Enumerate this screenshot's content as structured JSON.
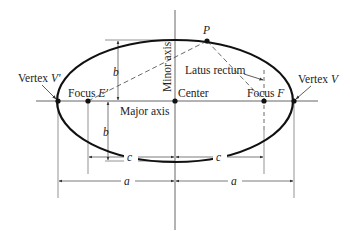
{
  "diagram": {
    "type": "ellipse-anatomy",
    "colors": {
      "stroke": "#111111",
      "guide": "#555555",
      "background": "#ffffff"
    },
    "geometry": {
      "center": [
        175,
        101
      ],
      "a": 118,
      "b": 61,
      "c": 88,
      "point_P": [
        207,
        41
      ]
    },
    "labels": {
      "vertex_left": "Vertex ",
      "vertex_left_sym": "V′",
      "vertex_right": "Vertex ",
      "vertex_right_sym": "V",
      "focus_left": "Focus ",
      "focus_left_sym": "E′",
      "focus_right": "Focus ",
      "focus_right_sym": "F",
      "center": "Center",
      "major_axis": "Major axis",
      "minor_axis": "Minor axis",
      "latus_rectum": "Latus rectum",
      "point": "P",
      "b_upper": "b",
      "b_lower": "b",
      "c_left": "c",
      "c_right": "c",
      "a_left": "a",
      "a_right": "a"
    }
  }
}
